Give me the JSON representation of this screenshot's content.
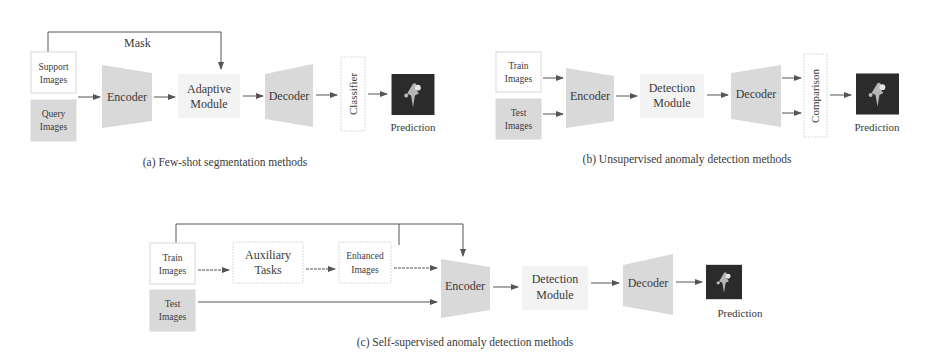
{
  "panel_a": {
    "caption": "(a) Few-shot segmentation methods",
    "mask_label": "Mask",
    "support": [
      "Support",
      "Images"
    ],
    "query": [
      "Query",
      "Images"
    ],
    "encoder": "Encoder",
    "adaptive": [
      "Adaptive",
      "Module"
    ],
    "decoder": "Decoder",
    "classifier": "Classifier",
    "prediction": "Prediction"
  },
  "panel_b": {
    "caption": "(b) Unsupervised anomaly detection methods",
    "train": [
      "Train",
      "Images"
    ],
    "test": [
      "Test",
      "Images"
    ],
    "encoder": "Encoder",
    "detection": [
      "Detection",
      "Module"
    ],
    "decoder": "Decoder",
    "comparison": "Comparison",
    "prediction": "Prediction"
  },
  "panel_c": {
    "caption": "(c) Self-supervised anomaly detection methods",
    "train": [
      "Train",
      "Images"
    ],
    "test": [
      "Test",
      "Images"
    ],
    "auxiliary": [
      "Auxiliary",
      "Tasks"
    ],
    "enhanced": [
      "Enhanced",
      "Images"
    ],
    "encoder": "Encoder",
    "detection": [
      "Detection",
      "Module"
    ],
    "decoder": "Decoder",
    "prediction": "Prediction"
  },
  "colors": {
    "box_border": "#d8d8d8",
    "shaded_fill": "#d9d9d9",
    "module_fill": "#f3f3f3",
    "arrow": "#555555",
    "prediction_bg": "#2a2a2a"
  }
}
